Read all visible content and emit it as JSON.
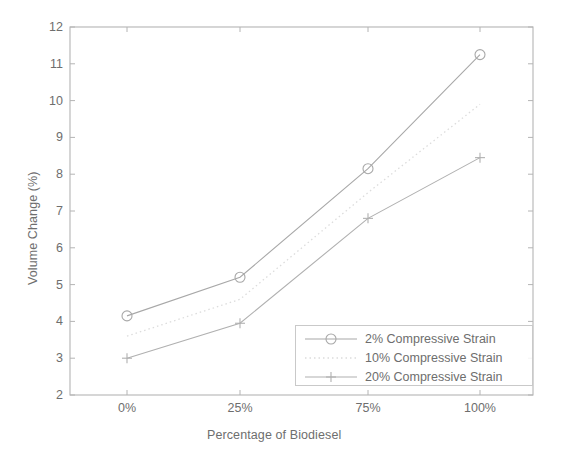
{
  "chart_data": {
    "type": "line",
    "title": "",
    "xlabel": "Percentage of Biodiesel",
    "ylabel": "Volume Change (%)",
    "categories": [
      "0%",
      "25%",
      "75%",
      "100%"
    ],
    "xtick_labels": [
      "0%",
      "25%",
      "75%",
      "100%"
    ],
    "ytick_labels": [
      "2",
      "3",
      "4",
      "5",
      "6",
      "7",
      "8",
      "9",
      "10",
      "11",
      "12"
    ],
    "ylim": [
      2,
      12
    ],
    "ytick_values": [
      2,
      3,
      4,
      5,
      6,
      7,
      8,
      9,
      10,
      11,
      12
    ],
    "grid": false,
    "legend_position": "lower right",
    "series": [
      {
        "name": "2% Compressive Strain",
        "values": [
          4.15,
          5.2,
          8.15,
          11.25
        ],
        "marker": "circle",
        "linestyle": "solid",
        "color": "#a8a8a8"
      },
      {
        "name": "10% Compressive Strain",
        "values": [
          3.6,
          4.6,
          7.5,
          9.9
        ],
        "marker": "none",
        "linestyle": "dotted",
        "color": "#dcdcdc"
      },
      {
        "name": "20% Compressive Strain",
        "values": [
          3.0,
          3.95,
          6.8,
          8.45
        ],
        "marker": "plus",
        "linestyle": "solid",
        "color": "#b0b0b0"
      }
    ]
  },
  "legend": {
    "entries": [
      "2% Compressive Strain",
      "10% Compressive Strain",
      "20% Compressive Strain"
    ]
  },
  "colors": {
    "axis": "#b4b4b4",
    "text": "#6e6e6e",
    "series_1": "#a8a8a8",
    "series_2": "#dcdcdc",
    "series_3": "#b0b0b0",
    "background": "#ffffff"
  }
}
